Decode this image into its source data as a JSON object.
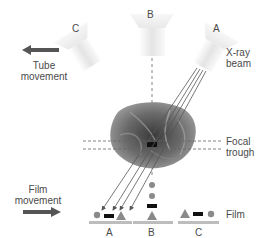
{
  "tubes": {
    "c_label": "C",
    "b_label": "B",
    "a_label": "A"
  },
  "labels": {
    "tube_movement_line1": "Tube",
    "tube_movement_line2": "movement",
    "xray_beam_line1": "X-ray",
    "xray_beam_line2": "beam",
    "focal_trough_line1": "Focal",
    "focal_trough_line2": "trough",
    "film_movement_line1": "Film",
    "film_movement_line2": "movement",
    "film": "Film"
  },
  "film_positions": {
    "a": "A",
    "b": "B",
    "c": "C"
  },
  "colors": {
    "arrow": "#555555",
    "shape_gray": "#8a8a8a",
    "rect_black": "#111111",
    "film_bar": "#b8b8b8",
    "beam_line": "#555555",
    "dashed": "#666666"
  }
}
